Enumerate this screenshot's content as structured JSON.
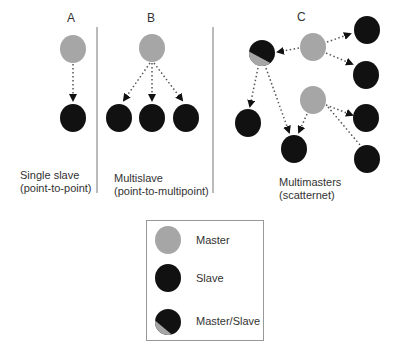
{
  "colors": {
    "master": "#a6a6a6",
    "slave": "#111111",
    "divider": "#777777",
    "dotted": "#555555"
  },
  "panels": [
    {
      "id": "A",
      "label": "A",
      "caption_line1": "Single slave",
      "caption_line2": "(point-to-point)"
    },
    {
      "id": "B",
      "label": "B",
      "caption_line1": "Multislave",
      "caption_line2": "(point-to-multipoint)"
    },
    {
      "id": "C",
      "label": "C",
      "caption_line1": "Multimasters",
      "caption_line2": "(scatternet)"
    }
  ],
  "legend": {
    "items": [
      {
        "label": "Master",
        "kind": "master"
      },
      {
        "label": "Slave",
        "kind": "slave"
      },
      {
        "label": "Master/Slave",
        "kind": "master-slave"
      }
    ]
  }
}
